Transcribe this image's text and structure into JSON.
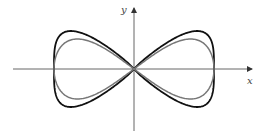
{
  "figure": {
    "axes": {
      "x_label": "x",
      "y_label": "y",
      "origin": [
        134,
        69
      ],
      "x_axis_range_px": [
        13,
        252
      ],
      "y_axis_range_px": [
        8,
        131
      ],
      "color": "#555555"
    },
    "curves": [
      {
        "name": "outer-figure-eight",
        "color": "#111111",
        "stroke_width": 1.8,
        "half_width_px": 80,
        "amplitude_px": 42,
        "shape_exponent": 0.55
      },
      {
        "name": "inner-figure-eight",
        "color": "#777777",
        "stroke_width": 1.5,
        "half_width_px": 80,
        "amplitude_px": 30,
        "shape_exponent": 1.0
      }
    ]
  }
}
